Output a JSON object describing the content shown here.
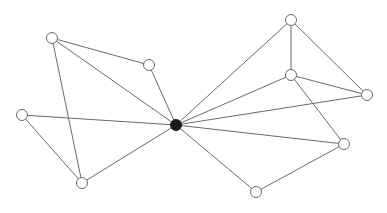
{
  "diagram": {
    "type": "network-graph",
    "background": "#ffffff",
    "edge_color": "#6b6b6b",
    "node_fill": "#ffffff",
    "hub_fill": "#1a1a1a",
    "node_radius": 5.5,
    "nodes": [
      {
        "id": "hub",
        "x": 176,
        "y": 125,
        "kind": "hub"
      },
      {
        "id": "A",
        "x": 52,
        "y": 38,
        "kind": "node"
      },
      {
        "id": "B",
        "x": 149,
        "y": 65,
        "kind": "node"
      },
      {
        "id": "C",
        "x": 22,
        "y": 115,
        "kind": "node"
      },
      {
        "id": "D",
        "x": 82,
        "y": 183,
        "kind": "node"
      },
      {
        "id": "E",
        "x": 291,
        "y": 20,
        "kind": "node"
      },
      {
        "id": "F",
        "x": 291,
        "y": 75,
        "kind": "node"
      },
      {
        "id": "G",
        "x": 367,
        "y": 95,
        "kind": "node"
      },
      {
        "id": "H",
        "x": 344,
        "y": 144,
        "kind": "node"
      },
      {
        "id": "I",
        "x": 256,
        "y": 192,
        "kind": "node"
      }
    ],
    "edges": [
      [
        "A",
        "B"
      ],
      [
        "A",
        "D"
      ],
      [
        "A",
        "hub"
      ],
      [
        "B",
        "hub"
      ],
      [
        "C",
        "hub"
      ],
      [
        "C",
        "D"
      ],
      [
        "D",
        "hub"
      ],
      [
        "E",
        "hub"
      ],
      [
        "E",
        "F"
      ],
      [
        "E",
        "G"
      ],
      [
        "F",
        "hub"
      ],
      [
        "F",
        "G"
      ],
      [
        "F",
        "H"
      ],
      [
        "G",
        "hub"
      ],
      [
        "H",
        "hub"
      ],
      [
        "H",
        "I"
      ],
      [
        "I",
        "hub"
      ]
    ]
  }
}
